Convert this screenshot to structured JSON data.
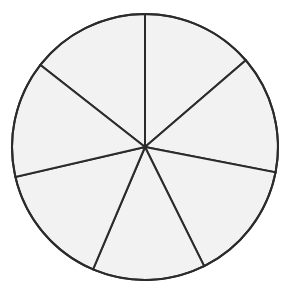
{
  "figure": {
    "name": "fraction-circle-sevenths",
    "shape": "circle",
    "background_color": "#ffffff",
    "fill_color": "#f2f2f2",
    "stroke_color": "#2b2b2b",
    "stroke_width": 2,
    "center_x": 145,
    "center_y": 147,
    "radius": 133,
    "sector_count": 7,
    "labels": {
      "title": "",
      "caption": ""
    }
  },
  "chart_data": {
    "type": "pie",
    "title": "",
    "xlabel": "",
    "ylabel": "",
    "legend_position": "none",
    "grid": false,
    "categories": [
      "sector-1",
      "sector-2",
      "sector-3",
      "sector-4",
      "sector-5",
      "sector-6",
      "sector-7"
    ],
    "values": [
      49,
      52,
      53,
      49,
      54,
      51,
      52
    ],
    "units": "degrees",
    "boundary_angles_deg": [
      90,
      40.7,
      -11,
      -63.6,
      -113,
      -167,
      141.9
    ],
    "slice_colors": [
      "#f2f2f2",
      "#f2f2f2",
      "#f2f2f2",
      "#f2f2f2",
      "#f2f2f2",
      "#f2f2f2",
      "#f2f2f2"
    ],
    "annotations": []
  }
}
